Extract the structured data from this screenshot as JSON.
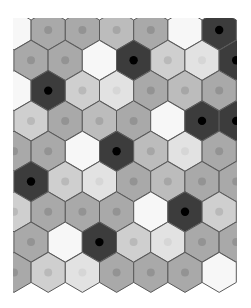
{
  "board": {
    "title": "Hex tile board",
    "clip": {
      "x": 13,
      "y": 18,
      "width": 224,
      "height": 290
    },
    "geometry": {
      "col_spacing": 34.2,
      "row_spacing": 30.3,
      "even_row_x0": 14,
      "odd_row_x0": 31,
      "y0": 30,
      "radius": 20
    },
    "colors": {
      "dark": "#3c3c3c",
      "mid": "#a9a9a9",
      "midlight": "#bcbcbc",
      "light": "#cfcfcf",
      "verylight": "#e2e2e2",
      "white": "#f7f7f7",
      "outline": "#5a5a5a",
      "dot_dark": "#000000",
      "dot_mid": "#939393",
      "dot_midlight": "#a6a6a6",
      "dot_light": "#b9b9b9",
      "dot_verylight": "#d6d6d6"
    },
    "rows": [
      [
        "white",
        "mid",
        "mid",
        "midlight",
        "mid",
        "white",
        "dark"
      ],
      [
        "mid",
        "mid",
        "white",
        "dark",
        "light",
        "verylight",
        "dark"
      ],
      [
        "white",
        "dark",
        "light",
        "verylight",
        "mid",
        "midlight",
        "mid"
      ],
      [
        "light",
        "mid",
        "midlight",
        "mid",
        "white",
        "dark",
        "dark"
      ],
      [
        "mid",
        "mid",
        "white",
        "dark",
        "midlight",
        "verylight",
        "mid"
      ],
      [
        "dark",
        "light",
        "verylight",
        "mid",
        "midlight",
        "mid",
        "mid"
      ],
      [
        "light",
        "mid",
        "mid",
        "mid",
        "white",
        "dark",
        "light"
      ],
      [
        "mid",
        "white",
        "dark",
        "light",
        "verylight",
        "mid",
        "mid"
      ],
      [
        "mid",
        "light",
        "verylight",
        "mid",
        "mid",
        "mid",
        "white"
      ]
    ]
  }
}
